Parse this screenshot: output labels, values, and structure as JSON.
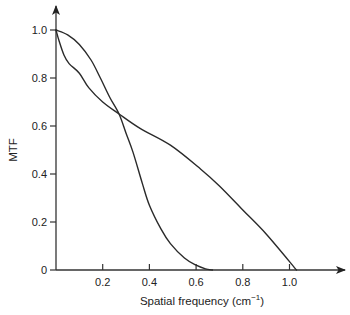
{
  "chart_data": {
    "type": "line",
    "title": "",
    "xlabel": "Spatial frequency (cm",
    "xlabel_superscript": "−1",
    "xlabel_close": ")",
    "ylabel": "MTF",
    "xlim": [
      0,
      1.2
    ],
    "ylim": [
      0,
      1.05
    ],
    "grid": false,
    "legend": null,
    "x_ticks": [
      {
        "value": 0.2,
        "label": "0.2"
      },
      {
        "value": 0.4,
        "label": "0.4"
      },
      {
        "value": 0.6,
        "label": "0.6"
      },
      {
        "value": 0.8,
        "label": "0.8"
      },
      {
        "value": 1.0,
        "label": "1.0"
      }
    ],
    "y_ticks": [
      {
        "value": 0,
        "label": "0"
      },
      {
        "value": 0.2,
        "label": "0.2"
      },
      {
        "value": 0.4,
        "label": "0.4"
      },
      {
        "value": 0.6,
        "label": "0.6"
      },
      {
        "value": 0.8,
        "label": "0.8"
      },
      {
        "value": 1.0,
        "label": "1.0"
      }
    ],
    "series": [
      {
        "name": "curve-steep",
        "description": "Starts high, crosses at ~0.27, cuts off at ~0.67",
        "x": [
          0.0,
          0.05,
          0.1,
          0.15,
          0.19,
          0.23,
          0.27,
          0.3,
          0.33,
          0.37,
          0.4,
          0.45,
          0.49,
          0.55,
          0.6,
          0.64,
          0.67
        ],
        "y": [
          1.0,
          0.98,
          0.94,
          0.875,
          0.8,
          0.72,
          0.65,
          0.57,
          0.49,
          0.36,
          0.27,
          0.17,
          0.11,
          0.05,
          0.02,
          0.005,
          0.0
        ]
      },
      {
        "name": "curve-gentle",
        "description": "Drops quickly near origin, crosses at ~0.27, near-linear decline to ~1.03",
        "x": [
          0.0,
          0.013,
          0.034,
          0.056,
          0.1,
          0.14,
          0.2,
          0.27,
          0.36,
          0.49,
          0.62,
          0.7,
          0.8,
          0.9,
          1.03
        ],
        "y": [
          1.0,
          0.955,
          0.896,
          0.86,
          0.82,
          0.76,
          0.7,
          0.65,
          0.59,
          0.52,
          0.42,
          0.35,
          0.25,
          0.15,
          0.0
        ]
      }
    ],
    "annotations": []
  },
  "plot_area": {
    "origin_px": [
      56,
      270
    ],
    "x_px_per_unit": 233.5,
    "y_px_per_unit": 240
  }
}
